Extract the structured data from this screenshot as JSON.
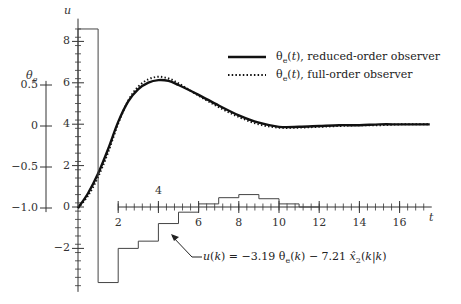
{
  "chart_data": {
    "type": "line",
    "title": "",
    "xlabel": "t",
    "ylabel_left": "θe",
    "ylabel_right": "u",
    "x_ticks": [
      2,
      4,
      6,
      8,
      10,
      12,
      14,
      16
    ],
    "x_range": [
      0,
      17.5
    ],
    "theta_ticks": [
      "0.5",
      "0",
      "−0.5",
      "−1.0"
    ],
    "u_ticks": [
      "8",
      "6",
      "4",
      "2",
      "0",
      "−2"
    ],
    "u_range": [
      -4,
      9
    ],
    "theta_range": [
      -1.0,
      0.65
    ],
    "legend_position": "upper right",
    "series": [
      {
        "name": "θe(t), reduced-order observer",
        "style": "solid",
        "axis": "theta",
        "x": [
          0,
          0.5,
          1,
          1.5,
          2,
          2.5,
          3,
          3.5,
          4,
          4.5,
          5,
          6,
          7,
          8,
          9,
          10,
          11,
          12,
          13,
          14,
          15,
          16,
          17,
          17.5
        ],
        "values": [
          -1.0,
          -0.82,
          -0.58,
          -0.28,
          0.05,
          0.3,
          0.45,
          0.53,
          0.56,
          0.55,
          0.5,
          0.38,
          0.25,
          0.13,
          0.04,
          -0.01,
          -0.01,
          0.0,
          0.01,
          0.01,
          0.02,
          0.02,
          0.02,
          0.02
        ]
      },
      {
        "name": "θe(t), full-order observer",
        "style": "dotted",
        "axis": "theta",
        "x": [
          0,
          0.5,
          1,
          1.5,
          2,
          2.5,
          3,
          3.5,
          4,
          4.5,
          5,
          6,
          7,
          8,
          9,
          10,
          11,
          12,
          13,
          14,
          15,
          16,
          17,
          17.5
        ],
        "values": [
          -1.0,
          -0.85,
          -0.62,
          -0.32,
          0.03,
          0.31,
          0.48,
          0.57,
          0.6,
          0.58,
          0.52,
          0.37,
          0.23,
          0.11,
          0.02,
          -0.02,
          -0.02,
          -0.01,
          0.0,
          0.01,
          0.01,
          0.02,
          0.02,
          0.02
        ]
      },
      {
        "name": "u(k) = −3.19 θe(k) − 7.21 x̂2(k|k)",
        "style": "step",
        "axis": "u",
        "x": [
          0,
          1,
          2,
          3,
          4,
          5,
          6,
          7,
          8,
          9,
          10,
          11,
          12
        ],
        "values": [
          8.6,
          -3.65,
          -2.0,
          -1.65,
          -0.8,
          -0.25,
          0.15,
          0.45,
          0.6,
          0.4,
          0.15,
          0.0,
          0.0
        ]
      }
    ]
  },
  "legend": {
    "solid_label": "θe(t), reduced-order observer",
    "dotted_label": "θe(t), full-order observer"
  },
  "annotation": {
    "text": "u(k) = −3.19 θe(k) − 7.21 x̂2(k|k)"
  },
  "axes": {
    "u_label": "u",
    "theta_label": "θe",
    "t_label": "t"
  }
}
